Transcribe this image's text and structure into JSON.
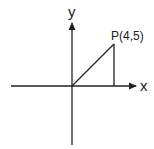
{
  "diagram": {
    "type": "coordinate-plane",
    "axes": {
      "x_label": "x",
      "y_label": "y"
    },
    "point": {
      "label": "P(4,5)",
      "x": 4,
      "y": 5
    },
    "colors": {
      "stroke": "#222222",
      "background": "#ffffff"
    }
  }
}
